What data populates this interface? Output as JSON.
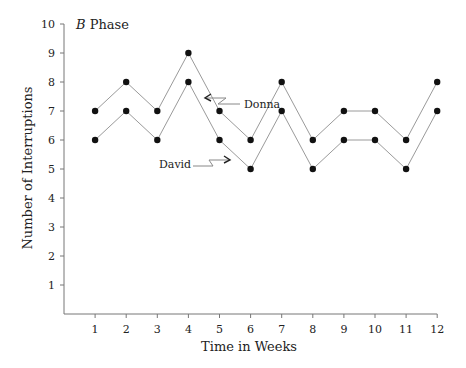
{
  "chart_data": {
    "type": "line",
    "title": "B Phase",
    "title_italic_part": "B",
    "title_rest": " Phase",
    "xlabel": "Time in Weeks",
    "ylabel": "Number of Interruptions",
    "x": [
      1,
      2,
      3,
      4,
      5,
      6,
      7,
      8,
      9,
      10,
      11,
      12
    ],
    "yticks": [
      1,
      2,
      3,
      4,
      5,
      6,
      7,
      8,
      9,
      10
    ],
    "ylim": [
      0,
      10
    ],
    "xlim": [
      0,
      12
    ],
    "grid": false,
    "series": [
      {
        "name": "Donna",
        "values": [
          7,
          8,
          7,
          9,
          7,
          6,
          8,
          6,
          7,
          7,
          6,
          8
        ]
      },
      {
        "name": "David",
        "values": [
          6,
          7,
          6,
          8,
          6,
          5,
          7,
          5,
          6,
          6,
          5,
          7
        ]
      }
    ],
    "annotations": [
      {
        "label": "Donna",
        "points_to": {
          "x": 4.5,
          "y": 8.1
        }
      },
      {
        "label": "David",
        "points_to": {
          "x": 5.5,
          "y": 5.2
        }
      }
    ]
  },
  "colors": {
    "line": "#9a9a9a",
    "marker": "#111111",
    "axis": "#777777",
    "text": "#222222"
  }
}
